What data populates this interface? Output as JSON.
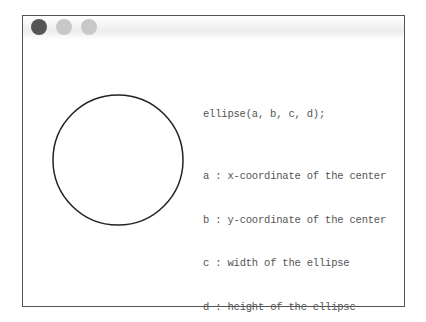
{
  "window": {
    "buttons": [
      {
        "name": "close",
        "color": "#555555"
      },
      {
        "name": "minimize",
        "color": "#c8c8c8"
      },
      {
        "name": "maximize",
        "color": "#c8c8c8"
      }
    ],
    "border_color": "#555555"
  },
  "canvas": {
    "shape": "circle",
    "cx": 95,
    "cy": 144,
    "r": 65,
    "stroke": "#222222"
  },
  "code": {
    "signature": "ellipse(a, b, c, d);",
    "params": [
      {
        "key": "a",
        "sep": ":",
        "desc": "x-coordinate of the center"
      },
      {
        "key": "b",
        "sep": ":",
        "desc": "y-coordinate of the center"
      },
      {
        "key": "c",
        "sep": ":",
        "desc": "width of the ellipse"
      },
      {
        "key": "d",
        "sep": ":",
        "desc": "height of the ellipse"
      }
    ]
  }
}
